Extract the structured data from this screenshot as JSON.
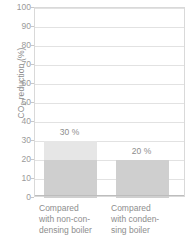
{
  "chart_data": {
    "type": "bar",
    "title": "",
    "xlabel": "",
    "ylabel": "CO2 reduction (%)",
    "ylabel_prefix": "CO",
    "ylabel_sub": "2",
    "ylabel_suffix": " reduction (%)",
    "ylim": [
      0,
      100
    ],
    "ytick_step": 10,
    "yticks": [
      "100",
      "90",
      "80",
      "70",
      "60",
      "50",
      "40",
      "30",
      "20",
      "10",
      "0"
    ],
    "ytick_values": [
      100,
      90,
      80,
      70,
      60,
      50,
      40,
      30,
      20,
      10,
      0
    ],
    "grid": true,
    "legend": "none",
    "categories": [
      "Compared with non-condensing boiler",
      "Compared with condensing boiler"
    ],
    "values": [
      30,
      20
    ],
    "data_labels": [
      "30 %",
      "20 %"
    ],
    "bars": [
      {
        "category_lines": [
          "Compared",
          "with non-con-",
          "densing boiler"
        ],
        "value": 30,
        "label": "30 %",
        "segments": [
          {
            "name": "lower",
            "from": 0,
            "to": 20,
            "color": "#cfcfcf"
          },
          {
            "name": "upper",
            "from": 20,
            "to": 30,
            "color": "#e6e6e6"
          }
        ]
      },
      {
        "category_lines": [
          "Compared",
          "with conden-",
          "sing boiler"
        ],
        "value": 20,
        "label": "20 %",
        "segments": [
          {
            "name": "lower",
            "from": 0,
            "to": 20,
            "color": "#cfcfcf"
          }
        ]
      }
    ],
    "colors": {
      "bar_dark": "#cfcfcf",
      "bar_light": "#e6e6e6",
      "grid": "#e2e2e2",
      "frame": "#d9d9d9",
      "text": "#8d8d8d",
      "background": "#ffffff"
    }
  }
}
